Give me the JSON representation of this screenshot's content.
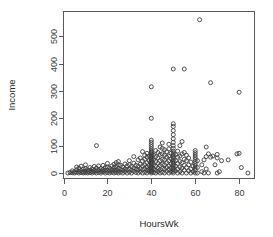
{
  "chart_data": {
    "type": "scatter",
    "title": "",
    "xlabel": "HoursWk",
    "ylabel": "Income",
    "xlim": [
      0,
      87
    ],
    "ylim": [
      -20,
      590
    ],
    "grid": false,
    "legend": null,
    "xticks": [
      0,
      20,
      40,
      60,
      80
    ],
    "xtick_labels": [
      "0",
      "20",
      "40",
      "60",
      "80"
    ],
    "yticks": [
      0,
      100,
      200,
      300,
      400,
      500
    ],
    "ytick_labels": [
      "0",
      "100",
      "200",
      "300",
      "400",
      "500"
    ],
    "marker": "open-circle",
    "marker_color": "#3d3d3d",
    "points": [
      [
        2,
        0
      ],
      [
        3,
        2
      ],
      [
        4,
        1
      ],
      [
        4,
        8
      ],
      [
        5,
        0
      ],
      [
        5,
        5
      ],
      [
        6,
        3
      ],
      [
        6,
        12
      ],
      [
        6,
        22
      ],
      [
        7,
        0
      ],
      [
        7,
        6
      ],
      [
        7,
        18
      ],
      [
        8,
        2
      ],
      [
        8,
        9
      ],
      [
        8,
        25
      ],
      [
        9,
        0
      ],
      [
        9,
        4
      ],
      [
        9,
        14
      ],
      [
        10,
        1
      ],
      [
        10,
        7
      ],
      [
        10,
        16
      ],
      [
        10,
        30
      ],
      [
        11,
        0
      ],
      [
        11,
        5
      ],
      [
        11,
        12
      ],
      [
        12,
        2
      ],
      [
        12,
        9
      ],
      [
        12,
        20
      ],
      [
        13,
        0
      ],
      [
        13,
        6
      ],
      [
        13,
        15
      ],
      [
        14,
        3
      ],
      [
        14,
        10
      ],
      [
        14,
        24
      ],
      [
        15,
        0
      ],
      [
        15,
        8
      ],
      [
        15,
        18
      ],
      [
        15,
        100
      ],
      [
        16,
        2
      ],
      [
        16,
        11
      ],
      [
        16,
        26
      ],
      [
        17,
        0
      ],
      [
        17,
        7
      ],
      [
        17,
        16
      ],
      [
        18,
        4
      ],
      [
        18,
        13
      ],
      [
        18,
        28
      ],
      [
        19,
        0
      ],
      [
        19,
        9
      ],
      [
        19,
        20
      ],
      [
        20,
        2
      ],
      [
        20,
        10
      ],
      [
        20,
        22
      ],
      [
        20,
        35
      ],
      [
        21,
        0
      ],
      [
        21,
        8
      ],
      [
        21,
        18
      ],
      [
        22,
        3
      ],
      [
        22,
        12
      ],
      [
        22,
        26
      ],
      [
        23,
        0
      ],
      [
        23,
        9
      ],
      [
        23,
        20
      ],
      [
        23,
        32
      ],
      [
        24,
        2
      ],
      [
        24,
        11
      ],
      [
        24,
        24
      ],
      [
        24,
        38
      ],
      [
        25,
        0
      ],
      [
        25,
        7
      ],
      [
        25,
        16
      ],
      [
        25,
        30
      ],
      [
        25,
        42
      ],
      [
        26,
        3
      ],
      [
        26,
        13
      ],
      [
        26,
        28
      ],
      [
        27,
        0
      ],
      [
        27,
        10
      ],
      [
        27,
        22
      ],
      [
        28,
        5
      ],
      [
        28,
        15
      ],
      [
        28,
        33
      ],
      [
        29,
        0
      ],
      [
        29,
        12
      ],
      [
        29,
        26
      ],
      [
        30,
        4
      ],
      [
        30,
        14
      ],
      [
        30,
        30
      ],
      [
        30,
        45
      ],
      [
        31,
        0
      ],
      [
        31,
        10
      ],
      [
        31,
        24
      ],
      [
        32,
        6
      ],
      [
        32,
        18
      ],
      [
        32,
        36
      ],
      [
        32,
        60
      ],
      [
        33,
        2
      ],
      [
        33,
        14
      ],
      [
        33,
        28
      ],
      [
        34,
        0
      ],
      [
        34,
        11
      ],
      [
        34,
        25
      ],
      [
        34,
        48
      ],
      [
        35,
        5
      ],
      [
        35,
        16
      ],
      [
        35,
        32
      ],
      [
        35,
        55
      ],
      [
        36,
        0
      ],
      [
        36,
        12
      ],
      [
        36,
        26
      ],
      [
        36,
        44
      ],
      [
        36,
        78
      ],
      [
        37,
        3
      ],
      [
        37,
        15
      ],
      [
        37,
        30
      ],
      [
        37,
        50
      ],
      [
        37,
        65
      ],
      [
        38,
        0
      ],
      [
        38,
        10
      ],
      [
        38,
        22
      ],
      [
        38,
        38
      ],
      [
        38,
        58
      ],
      [
        38,
        72
      ],
      [
        39,
        5
      ],
      [
        39,
        14
      ],
      [
        39,
        28
      ],
      [
        39,
        45
      ],
      [
        39,
        62
      ],
      [
        40,
        0
      ],
      [
        40,
        4
      ],
      [
        40,
        8
      ],
      [
        40,
        12
      ],
      [
        40,
        16
      ],
      [
        40,
        20
      ],
      [
        40,
        24
      ],
      [
        40,
        28
      ],
      [
        40,
        32
      ],
      [
        40,
        36
      ],
      [
        40,
        40
      ],
      [
        40,
        44
      ],
      [
        40,
        48
      ],
      [
        40,
        52
      ],
      [
        40,
        56
      ],
      [
        40,
        60
      ],
      [
        40,
        64
      ],
      [
        40,
        68
      ],
      [
        40,
        72
      ],
      [
        40,
        76
      ],
      [
        40,
        80
      ],
      [
        40,
        88
      ],
      [
        40,
        96
      ],
      [
        40,
        104
      ],
      [
        40,
        112
      ],
      [
        40,
        120
      ],
      [
        40,
        200
      ],
      [
        40,
        315
      ],
      [
        41,
        2
      ],
      [
        41,
        15
      ],
      [
        41,
        30
      ],
      [
        41,
        48
      ],
      [
        41,
        66
      ],
      [
        42,
        0
      ],
      [
        42,
        10
      ],
      [
        42,
        25
      ],
      [
        42,
        42
      ],
      [
        42,
        60
      ],
      [
        42,
        82
      ],
      [
        43,
        5
      ],
      [
        43,
        18
      ],
      [
        43,
        35
      ],
      [
        43,
        55
      ],
      [
        43,
        75
      ],
      [
        44,
        0
      ],
      [
        44,
        12
      ],
      [
        44,
        28
      ],
      [
        44,
        46
      ],
      [
        44,
        68
      ],
      [
        44,
        95
      ],
      [
        45,
        3
      ],
      [
        45,
        16
      ],
      [
        45,
        32
      ],
      [
        45,
        50
      ],
      [
        45,
        70
      ],
      [
        45,
        90
      ],
      [
        45,
        110
      ],
      [
        46,
        0
      ],
      [
        46,
        14
      ],
      [
        46,
        30
      ],
      [
        46,
        48
      ],
      [
        46,
        65
      ],
      [
        46,
        85
      ],
      [
        47,
        6
      ],
      [
        47,
        20
      ],
      [
        47,
        38
      ],
      [
        47,
        58
      ],
      [
        47,
        78
      ],
      [
        48,
        0
      ],
      [
        48,
        12
      ],
      [
        48,
        26
      ],
      [
        48,
        44
      ],
      [
        48,
        62
      ],
      [
        48,
        88
      ],
      [
        48,
        105
      ],
      [
        49,
        4
      ],
      [
        49,
        18
      ],
      [
        49,
        34
      ],
      [
        49,
        52
      ],
      [
        49,
        72
      ],
      [
        50,
        0
      ],
      [
        50,
        6
      ],
      [
        50,
        12
      ],
      [
        50,
        18
      ],
      [
        50,
        24
      ],
      [
        50,
        30
      ],
      [
        50,
        36
      ],
      [
        50,
        42
      ],
      [
        50,
        48
      ],
      [
        50,
        54
      ],
      [
        50,
        60
      ],
      [
        50,
        66
      ],
      [
        50,
        72
      ],
      [
        50,
        80
      ],
      [
        50,
        90
      ],
      [
        50,
        100
      ],
      [
        50,
        112
      ],
      [
        50,
        125
      ],
      [
        50,
        140
      ],
      [
        50,
        155
      ],
      [
        50,
        170
      ],
      [
        50,
        180
      ],
      [
        50,
        380
      ],
      [
        51,
        8
      ],
      [
        51,
        25
      ],
      [
        51,
        45
      ],
      [
        51,
        68
      ],
      [
        52,
        0
      ],
      [
        52,
        15
      ],
      [
        52,
        35
      ],
      [
        52,
        58
      ],
      [
        52,
        80
      ],
      [
        53,
        5
      ],
      [
        53,
        22
      ],
      [
        53,
        42
      ],
      [
        53,
        62
      ],
      [
        53,
        100
      ],
      [
        54,
        0
      ],
      [
        54,
        18
      ],
      [
        54,
        38
      ],
      [
        54,
        70
      ],
      [
        54,
        115
      ],
      [
        55,
        10
      ],
      [
        55,
        28
      ],
      [
        55,
        50
      ],
      [
        55,
        75
      ],
      [
        55,
        380
      ],
      [
        56,
        0
      ],
      [
        56,
        20
      ],
      [
        56,
        45
      ],
      [
        56,
        65
      ],
      [
        57,
        8
      ],
      [
        57,
        30
      ],
      [
        57,
        55
      ],
      [
        58,
        0
      ],
      [
        58,
        15
      ],
      [
        58,
        40
      ],
      [
        59,
        5
      ],
      [
        59,
        25
      ],
      [
        60,
        0
      ],
      [
        60,
        10
      ],
      [
        60,
        18
      ],
      [
        60,
        26
      ],
      [
        60,
        34
      ],
      [
        60,
        42
      ],
      [
        60,
        50
      ],
      [
        60,
        58
      ],
      [
        60,
        66
      ],
      [
        60,
        74
      ],
      [
        60,
        82
      ],
      [
        61,
        0
      ],
      [
        61,
        20
      ],
      [
        61,
        45
      ],
      [
        62,
        560
      ],
      [
        63,
        5
      ],
      [
        63,
        30
      ],
      [
        64,
        0
      ],
      [
        64,
        48
      ],
      [
        65,
        95
      ],
      [
        65,
        15
      ],
      [
        65,
        60
      ],
      [
        66,
        0
      ],
      [
        66,
        70
      ],
      [
        67,
        330
      ],
      [
        67,
        58
      ],
      [
        68,
        62
      ],
      [
        69,
        30
      ],
      [
        70,
        0
      ],
      [
        70,
        55
      ],
      [
        70,
        68
      ],
      [
        71,
        5
      ],
      [
        72,
        45
      ],
      [
        75,
        48
      ],
      [
        79,
        70
      ],
      [
        80,
        72
      ],
      [
        80,
        295
      ],
      [
        81,
        20
      ],
      [
        84,
        0
      ]
    ]
  }
}
